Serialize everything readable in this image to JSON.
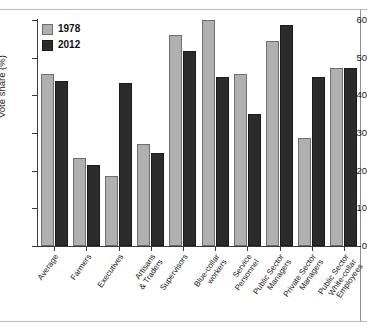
{
  "chart_data": {
    "type": "bar",
    "title": "",
    "xlabel": "",
    "ylabel": "Vote share (%)",
    "ylim": [
      0,
      60
    ],
    "yticks": [
      0,
      10,
      20,
      30,
      40,
      50,
      60
    ],
    "grid": false,
    "legend_position": "top-left",
    "categories": [
      "Average",
      "Farmers",
      "Executives",
      "Artisans\n& Traders",
      "Supervisors",
      "Blue-collar\nworkers",
      "Service\nPersonnel",
      "Public Sector\nManagers",
      "Private Sector\nManagers",
      "Public Sector\nWhite-collar\nEmployees"
    ],
    "series": [
      {
        "name": "1978",
        "color": "#b0b0b0",
        "values": [
          45.6,
          23.4,
          18.6,
          27.0,
          56.0,
          60.0,
          45.6,
          54.5,
          28.8,
          47.3
        ]
      },
      {
        "name": "2012",
        "color": "#2b2b2b",
        "values": [
          43.8,
          21.6,
          43.2,
          24.8,
          51.8,
          45.0,
          35.0,
          58.8,
          45.0,
          47.3
        ]
      }
    ]
  },
  "legend": {
    "items": [
      {
        "label": "1978"
      },
      {
        "label": "2012"
      }
    ]
  },
  "axes": {
    "y_label": "Vote share (%)",
    "y_tick_labels": [
      "60",
      "50",
      "40",
      "30",
      "20",
      "10",
      "0"
    ]
  },
  "header": {
    "title_fragment": ""
  }
}
